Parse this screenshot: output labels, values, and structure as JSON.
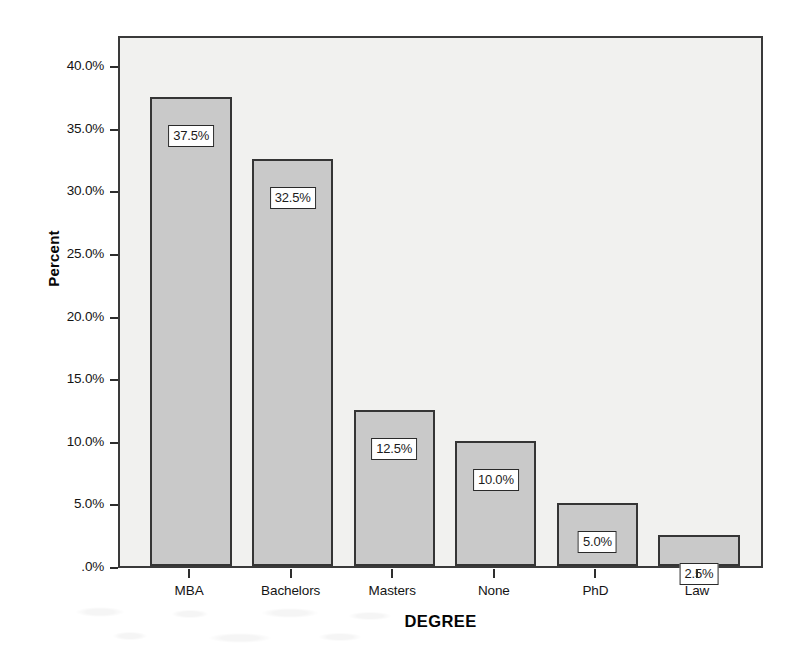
{
  "chart_data": {
    "type": "bar",
    "title": "",
    "xlabel": "DEGREE",
    "ylabel": "Percent",
    "categories": [
      "MBA",
      "Bachelors",
      "Masters",
      "None",
      "PhD",
      "Law"
    ],
    "values": [
      37.5,
      32.5,
      12.5,
      10.0,
      5.0,
      2.5
    ],
    "data_labels": [
      "37.5%",
      "32.5%",
      "12.5%",
      "10.0%",
      "5.0%",
      "2.5%"
    ],
    "ylim": [
      0,
      42.5
    ],
    "y_tick_values": [
      40.0,
      35.0,
      30.0,
      25.0,
      20.0,
      15.0,
      10.0,
      5.0,
      0.0
    ],
    "y_tick_labels": [
      "40.0%",
      "35.0%",
      "30.0%",
      "25.0%",
      "20.0%",
      "15.0%",
      "10.0%",
      "5.0%",
      ".0%"
    ],
    "grid": false,
    "legend": "none",
    "colors": {
      "bar_fill": "#c9c9c9",
      "bar_border": "#353535",
      "plot_background": "#f1f1ef",
      "frame": "#3a3a3a",
      "label_box_background": "#ffffff",
      "label_box_border": "#2a2a2a",
      "text": "#141414"
    }
  }
}
